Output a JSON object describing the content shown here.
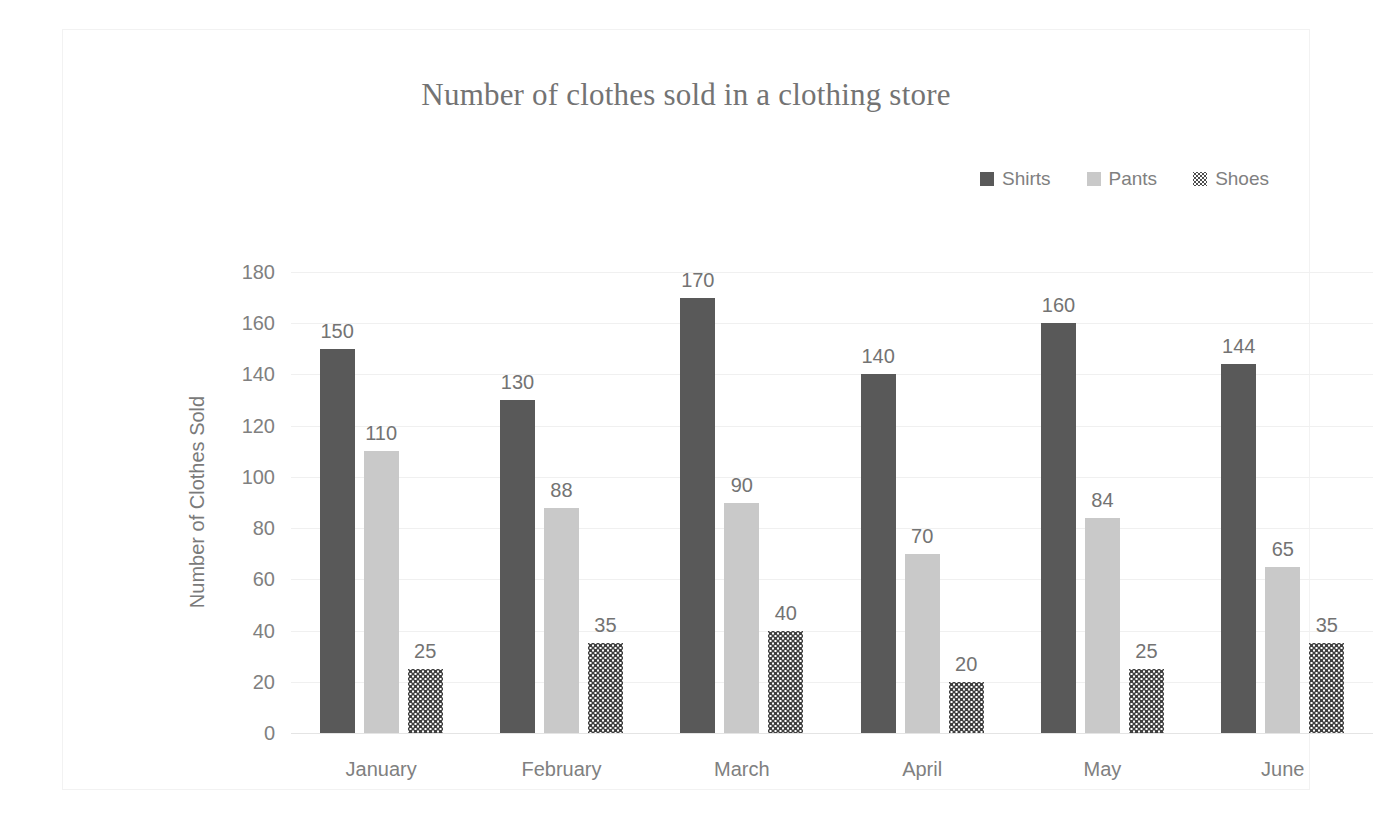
{
  "chart_data": {
    "type": "bar",
    "title": "Number of clothes sold in a clothing store",
    "xlabel": "",
    "ylabel": "Number of Clothes Sold",
    "categories": [
      "January",
      "February",
      "March",
      "April",
      "May",
      "June"
    ],
    "series": [
      {
        "name": "Shirts",
        "color": "#595959",
        "pattern": "solid",
        "values": [
          150,
          130,
          170,
          140,
          160,
          144
        ]
      },
      {
        "name": "Pants",
        "color": "#c9c9c9",
        "pattern": "solid",
        "values": [
          110,
          88,
          90,
          70,
          84,
          65
        ]
      },
      {
        "name": "Shoes",
        "color": "#3f3f3f",
        "pattern": "dotted",
        "values": [
          25,
          35,
          40,
          20,
          25,
          35
        ]
      }
    ],
    "ylim": [
      0,
      180
    ],
    "yticks": [
      180,
      160,
      140,
      120,
      100,
      80,
      60,
      40,
      20,
      0
    ],
    "grid": true,
    "data_labels": true,
    "legend_position": "top-right",
    "legend": [
      "Shirts",
      "Pants",
      "Shoes"
    ]
  },
  "legend_icons": {
    "shirts": "square-marker-icon",
    "pants": "square-marker-icon",
    "shoes": "dotted-square-marker-icon"
  }
}
